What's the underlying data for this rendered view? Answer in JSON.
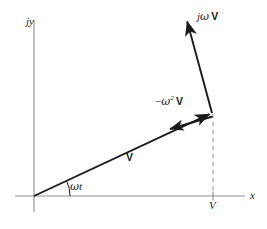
{
  "figure": {
    "background_color": "#ffffff",
    "stroke_color": "#1a1a1a",
    "axis_color": "#8a8a8a",
    "dash_color": "#9a9a9a",
    "width": 267,
    "height": 229
  },
  "axes": {
    "vertical": {
      "name": "imaginary-axis",
      "label": "jy",
      "x": 34,
      "y_top": 20,
      "y_bottom": 212
    },
    "horizontal": {
      "name": "real-axis",
      "label": "x",
      "y": 196,
      "x_left": 15,
      "x_right": 245
    },
    "origin": {
      "x": 34,
      "y": 196
    }
  },
  "tick": {
    "label": "V",
    "x": 213,
    "y": 196
  },
  "vectors": [
    {
      "name": "vector-V",
      "label": "V",
      "label_style": "bold",
      "from": {
        "x": 34,
        "y": 196
      },
      "to": {
        "x": 212,
        "y": 113
      },
      "label_pos": {
        "x": 126,
        "y": 152
      }
    },
    {
      "name": "vector-jwV",
      "label_prefix": "j",
      "label_omega": "ω",
      "label_suffix": "V",
      "label_full": "jω V",
      "from": {
        "x": 212,
        "y": 113
      },
      "to": {
        "x": 186,
        "y": 17
      },
      "label_pos": {
        "x": 197,
        "y": 11
      }
    },
    {
      "name": "vector-neg-omega-squared-V",
      "label_prefix": "−",
      "label_omega": "ω",
      "label_exponent": "2",
      "label_suffix": "V",
      "label_full": "−ω² V",
      "from": {
        "x": 212,
        "y": 116
      },
      "to": {
        "x": 166,
        "y": 130
      },
      "label_pos": {
        "x": 155,
        "y": 95
      }
    }
  ],
  "angle": {
    "name": "angle-omega-t",
    "label": "ωt",
    "label_omega": "ω",
    "label_t": "t",
    "vertex": {
      "x": 34,
      "y": 196
    },
    "label_pos": {
      "x": 70,
      "y": 181
    },
    "degrees": 25
  },
  "projection": {
    "name": "projection-dashed-line",
    "x": 213,
    "y_top": 115,
    "y_bottom": 196,
    "style": "dashed"
  }
}
